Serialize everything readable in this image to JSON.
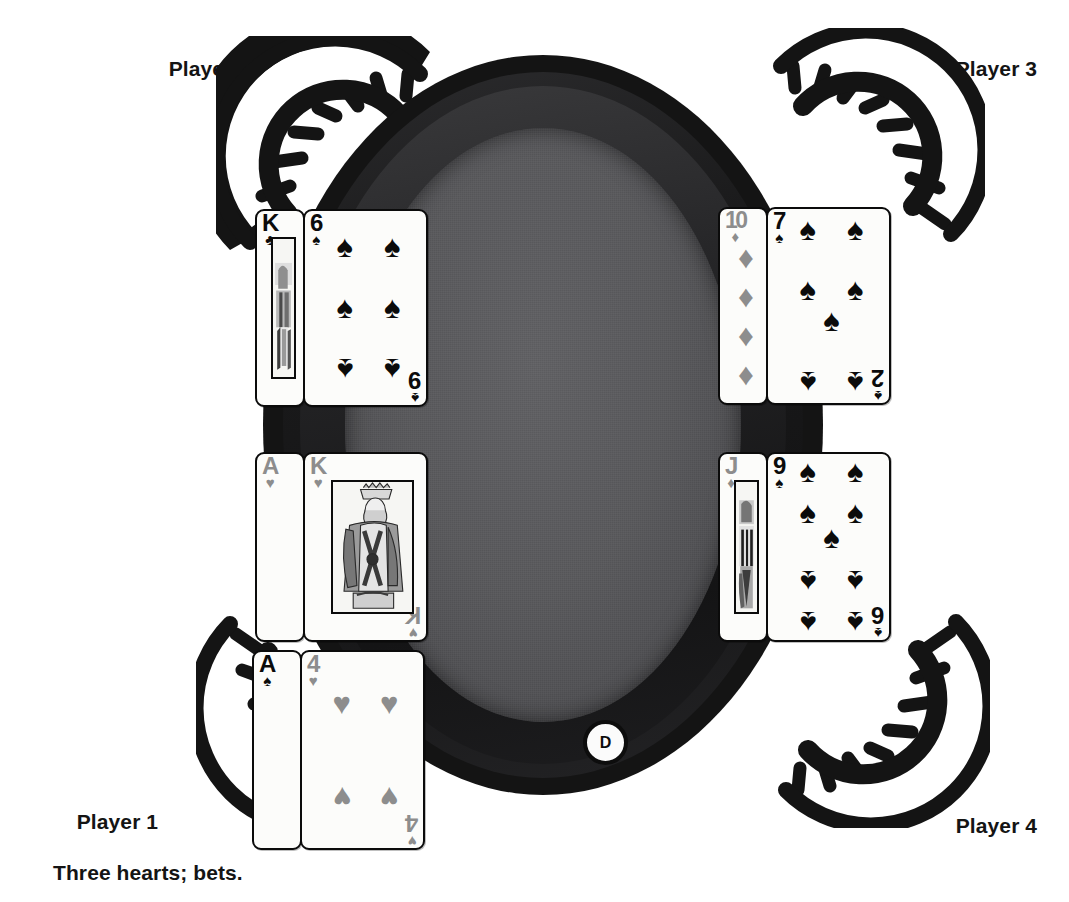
{
  "scene": {
    "title": "Poker table with four players",
    "felt_color": "#59595c",
    "rail_color": "#1b1b1c",
    "card_face_color": "#fcfcfa",
    "black_suit_color": "#0b0b0b",
    "red_suit_color_grayscale": "#8d8d8d"
  },
  "players": [
    {
      "id": "p1",
      "label": "Player 1",
      "note": "Three hearts; bets."
    },
    {
      "id": "p2",
      "label": "Player 2",
      "note": ""
    },
    {
      "id": "p3",
      "label": "Player 3",
      "note": ""
    },
    {
      "id": "p4",
      "label": "Player 4",
      "note": ""
    }
  ],
  "dealer_button": {
    "label": "D"
  },
  "hands": {
    "p2": {
      "owner": "Player 2",
      "cards": [
        {
          "rank": "K",
          "suit": "clubs",
          "suit_glyph": "♣",
          "color": "black",
          "type": "face",
          "pip_count": 0
        },
        {
          "rank": "6",
          "suit": "spades",
          "suit_glyph": "♠",
          "color": "black",
          "type": "pip",
          "pip_count": 6,
          "corner_br_rank": "9"
        }
      ]
    },
    "p3": {
      "owner": "Player 3",
      "cards": [
        {
          "rank": "10",
          "suit": "diamonds",
          "suit_glyph": "♦",
          "color": "gray",
          "type": "pip",
          "pip_count": 10
        },
        {
          "rank": "7",
          "suit": "spades",
          "suit_glyph": "♠",
          "color": "black",
          "type": "pip",
          "pip_count": 7,
          "corner_br_rank": "2"
        }
      ]
    },
    "p1_upper": {
      "owner": "Player 1",
      "cards": [
        {
          "rank": "A",
          "suit": "hearts",
          "suit_glyph": "♥",
          "color": "gray",
          "type": "pip",
          "pip_count": 1
        },
        {
          "rank": "K",
          "suit": "hearts",
          "suit_glyph": "♥",
          "color": "gray",
          "type": "face",
          "pip_count": 0,
          "corner_br_rank": "K"
        }
      ]
    },
    "p4": {
      "owner": "Player 4",
      "cards": [
        {
          "rank": "J",
          "suit": "diamonds",
          "suit_glyph": "♦",
          "color": "gray",
          "type": "face",
          "pip_count": 0
        },
        {
          "rank": "9",
          "suit": "spades",
          "suit_glyph": "♠",
          "color": "black",
          "type": "pip",
          "pip_count": 9,
          "corner_br_rank": "6"
        }
      ]
    },
    "p1_lower": {
      "owner": "Player 1",
      "cards": [
        {
          "rank": "A",
          "suit": "spades",
          "suit_glyph": "♠",
          "color": "black",
          "type": "pip",
          "pip_count": 1
        },
        {
          "rank": "4",
          "suit": "hearts",
          "suit_glyph": "♥",
          "color": "gray",
          "type": "pip",
          "pip_count": 4,
          "corner_br_rank": "4"
        }
      ]
    }
  }
}
